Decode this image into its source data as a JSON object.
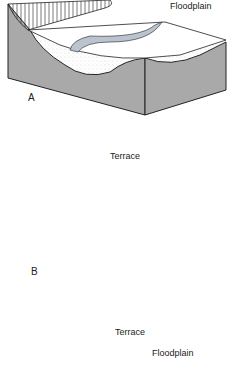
{
  "diagram": {
    "panels": [
      {
        "letter": "A",
        "labels": [
          "Floodplain"
        ]
      },
      {
        "letter": "B",
        "labels": [
          "Terrace"
        ]
      },
      {
        "letter": "C",
        "labels": [
          "Terrace",
          "Floodplain"
        ]
      }
    ]
  },
  "colors": {
    "side": "#a9a9a9",
    "river": "#b9c4cf",
    "outline": "#222222",
    "stipple": "#bbbbbb"
  }
}
